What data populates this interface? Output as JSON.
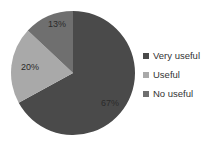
{
  "chart_data": {
    "type": "pie",
    "title": "",
    "categories": [
      "Very useful",
      "Useful",
      "No useful"
    ],
    "values": [
      67,
      20,
      13
    ],
    "labels": [
      "67%",
      "20%",
      "13%"
    ],
    "colors": [
      "#4a4a4a",
      "#a9a9a9",
      "#6f6f6f"
    ],
    "start_angle": "12 o'clock, clockwise",
    "legend_position": "right"
  },
  "legend": {
    "items": [
      {
        "label": "Very useful",
        "color": "#4a4a4a"
      },
      {
        "label": "Useful",
        "color": "#a9a9a9"
      },
      {
        "label": "No useful",
        "color": "#6f6f6f"
      }
    ]
  }
}
